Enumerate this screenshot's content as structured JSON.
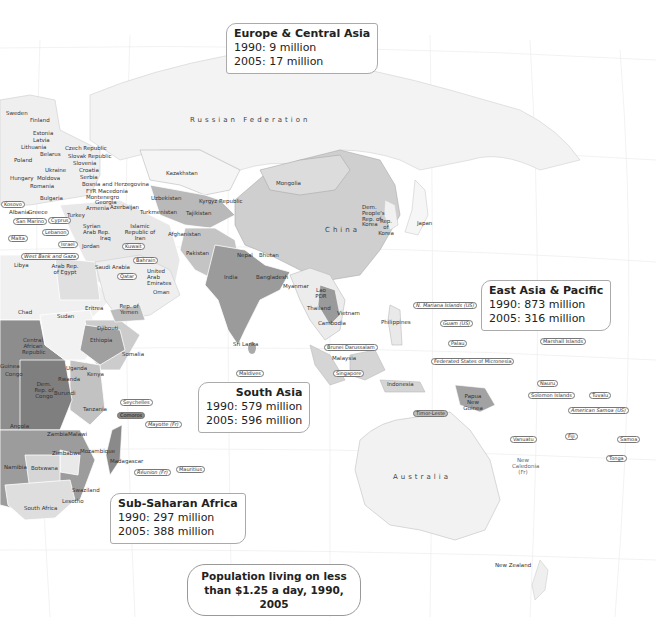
{
  "legend": {
    "line1": "Population living on less",
    "line2": "than $1.25 a day, 1990, 2005"
  },
  "regions": {
    "europe_central_asia": {
      "name": "Europe & Central Asia",
      "y1990": "1990: 9 million",
      "y2005": "2005: 17 million"
    },
    "east_asia_pacific": {
      "name": "East Asia & Pacific",
      "y1990": "1990: 873 million",
      "y2005": "2005: 316 million"
    },
    "south_asia": {
      "name": "South Asia",
      "y1990": "1990: 579 million",
      "y2005": "2005: 596 million"
    },
    "sub_saharan_africa": {
      "name": "Sub-Saharan Africa",
      "y1990": "1990: 297 million",
      "y2005": "2005: 388 million"
    }
  },
  "colors": {
    "sea": "#ffffff",
    "land_light": "#efefef",
    "land_light2": "#e0e0e0",
    "land_mid": "#c8c8c8",
    "land_mid2": "#b0b0b0",
    "land_dark": "#8f8f8f",
    "land_darker": "#7a7a7a",
    "border": "#ffffff",
    "grid": "#e6e6e6"
  },
  "labels": {
    "russia": "Russian Federation",
    "china": "China",
    "australia": "Australia",
    "sweden": "Sweden",
    "finland": "Finland",
    "estonia": "Estonia",
    "latvia": "Latvia",
    "lithuania": "Lithuania",
    "poland": "Poland",
    "belarus": "Belarus",
    "ukraine": "Ukraine",
    "czech": "Czech Republic",
    "slovak": "Slovak Republic",
    "slovenia": "Slovenia",
    "croatia": "Croatia",
    "serbia": "Serbia",
    "bosnia": "Bosnia and Herzegovina",
    "fyrm": "FYR Macedonia",
    "montenegro": "Montenegro",
    "hungary": "Hungary",
    "moldova": "Moldova",
    "romania": "Romania",
    "bulgaria": "Bulgaria",
    "kosovo": "Kosovo",
    "albania": "Albania",
    "greece": "Greece",
    "san_marino": "San Marino",
    "malta": "Malta",
    "cyprus": "Cyprus",
    "lebanon": "Lebanon",
    "israel": "Israel",
    "west_bank": "West Bank and Gaza",
    "turkey": "Turkey",
    "georgia": "Georgia",
    "armenia": "Armenia",
    "azerbaijan": "Azerbaijan",
    "syria": "Syrian Arab Rep.",
    "iraq": "Iraq",
    "jordan": "Jordan",
    "iran": "Islamic Republic of Iran",
    "kuwait": "Kuwait",
    "bahrain": "Bahrain",
    "qatar": "Qatar",
    "uae": "United Arab Emirates",
    "oman": "Oman",
    "saudi": "Saudi Arabia",
    "yemen": "Rep. of Yemen",
    "egypt": "Arab Rep. of Egypt",
    "libya": "Libya",
    "kazakhstan": "Kazakhstan",
    "uzbekistan": "Uzbekistan",
    "turkmenistan": "Turkmenistan",
    "kyrgyz": "Kyrgyz Republic",
    "tajikistan": "Tajikistan",
    "afghanistan": "Afghanistan",
    "pakistan": "Pakistan",
    "india": "India",
    "nepal": "Nepal",
    "bhutan": "Bhutan",
    "bangladesh": "Bangladesh",
    "sri_lanka": "Sri Lanka",
    "maldives": "Maldives",
    "mongolia": "Mongolia",
    "dprk": "Dem. People's Rep. of Korea",
    "korea": "Rep. of Korea",
    "japan": "Japan",
    "myanmar": "Myanmar",
    "lao": "Lao PDR",
    "thailand": "Thailand",
    "vietnam": "Vietnam",
    "cambodia": "Cambodia",
    "philippines": "Philippines",
    "brunei": "Brunei Darussalam",
    "malaysia": "Malaysia",
    "singapore": "Singapore",
    "indonesia": "Indonesia",
    "timor": "Timor-Leste",
    "png": "Papua New Guinea",
    "n_mariana": "N. Mariana Islands (US)",
    "guam": "Guam (US)",
    "palau": "Palau",
    "micronesia": "Federated States of Micronesia",
    "marshall": "Marshall Islands",
    "nauru": "Nauru",
    "solomon": "Solomon Islands",
    "tuvalu": "Tuvalu",
    "am_samoa": "American Samoa (US)",
    "vanuatu": "Vanuatu",
    "fiji": "Fiji",
    "samoa": "Samoa",
    "tonga": "Tonga",
    "new_caledonia": "New Caledonia (Fr)",
    "new_zealand": "New Zealand",
    "chad": "Chad",
    "sudan": "Sudan",
    "eritrea": "Eritrea",
    "djibouti": "Djibouti",
    "ethiopia": "Ethiopia",
    "somalia": "Somalia",
    "car": "Central African Republic",
    "guinea": "Guinea",
    "congo": "Congo",
    "drc": "Dem. Rep. of Congo",
    "uganda": "Uganda",
    "kenya": "Kenya",
    "rwanda": "Rwanda",
    "burundi": "Burundi",
    "tanzania": "Tanzania",
    "seychelles": "Seychelles",
    "comoros": "Comoros",
    "mayotte": "Mayotte (Fr)",
    "angola": "Angola",
    "zambia": "Zambia",
    "malawi": "Malawi",
    "zimbabwe": "Zimbabwe",
    "mozambique": "Mozambique",
    "madagascar": "Madagascar",
    "reunion": "Réunion (Fr)",
    "mauritius": "Mauritius",
    "namibia": "Namibia",
    "botswana": "Botswana",
    "swaziland": "Swaziland",
    "lesotho": "Lesotho",
    "south_africa": "South Africa"
  }
}
